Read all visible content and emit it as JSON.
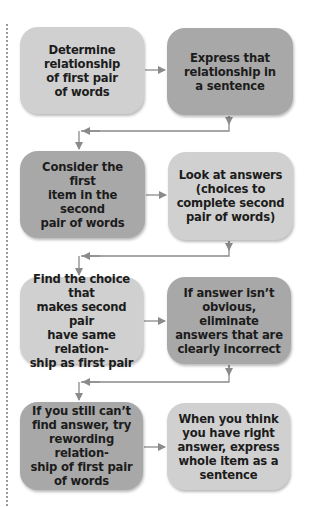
{
  "diagram": {
    "type": "flowchart",
    "colors": {
      "light_box": "#d0d0d0",
      "dark_box": "#a8a8a8",
      "text": "#1c1c1c",
      "arrow": "#8a8a8a"
    },
    "steps": [
      {
        "id": 1,
        "shade": "light",
        "text": "Determine\nrelationship\nof first pair\nof words"
      },
      {
        "id": 2,
        "shade": "dark",
        "text": "Express that\nrelationship in\na sentence"
      },
      {
        "id": 3,
        "shade": "dark",
        "text": "Consider the first\nitem in the second\npair of words"
      },
      {
        "id": 4,
        "shade": "light",
        "text": "Look at answers\n(choices to\ncomplete second\npair of words)"
      },
      {
        "id": 5,
        "shade": "light",
        "text": "Find the choice that\nmakes second pair\nhave same relation-\nship as first pair"
      },
      {
        "id": 6,
        "shade": "dark",
        "text": "If answer isn’t\nobvious, eliminate\nanswers that are\nclearly incorrect"
      },
      {
        "id": 7,
        "shade": "dark",
        "text": "If you still can’t\nfind answer, try\nrewording relation-\nship of first pair\nof words"
      },
      {
        "id": 8,
        "shade": "light",
        "text": "When you think\nyou have right\nanswer, express\nwhole item as a\nsentence"
      }
    ],
    "edges": [
      {
        "from": 1,
        "to": 2
      },
      {
        "from": 2,
        "to": 3
      },
      {
        "from": 3,
        "to": 4
      },
      {
        "from": 4,
        "to": 5
      },
      {
        "from": 5,
        "to": 6
      },
      {
        "from": 6,
        "to": 7
      },
      {
        "from": 7,
        "to": 8
      }
    ]
  }
}
